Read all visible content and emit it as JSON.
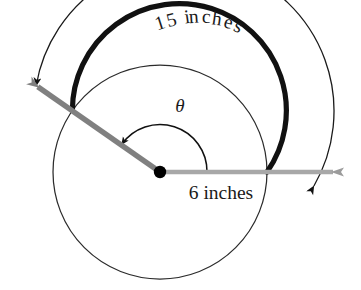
{
  "figure": {
    "name": "circle-sector-arc-length-diagram",
    "type": "geometry-diagram",
    "background_color": "#ffffff"
  },
  "labels": {
    "arc_length": "15 inches",
    "radius": "6 inches",
    "angle_symbol": "θ"
  },
  "colors": {
    "ray_gray": "#808080",
    "ray_gray_light": "#a8a8a8",
    "arc_black": "#111111",
    "circle_outline": "#2b2b2b",
    "center_dot": "#000000",
    "text": "#1a1a1a"
  },
  "geometry": {
    "center_x": 160,
    "center_y": 172,
    "circle_radius": 107,
    "bold_arc_radius": 107,
    "bold_arc_start_angle_deg": 145,
    "bold_arc_end_angle_deg": 0,
    "measure_arc_radius": 150,
    "theta_arc_radius": 47,
    "terminal_ray_angle_deg": 145,
    "initial_ray_angle_deg": 0,
    "terminal_ray_length": 148,
    "initial_ray_length": 185
  },
  "curved_label_chars": [
    {
      "ch": "1",
      "x": 162,
      "y": 29,
      "rot": -18
    },
    {
      "ch": "5",
      "x": 173,
      "y": 26,
      "rot": -14
    },
    {
      "ch": " ",
      "x": 182,
      "y": 24,
      "rot": -11
    },
    {
      "ch": "i",
      "x": 188,
      "y": 23,
      "rot": -8
    },
    {
      "ch": "n",
      "x": 194,
      "y": 23,
      "rot": -4
    },
    {
      "ch": "c",
      "x": 206,
      "y": 23,
      "rot": 2
    },
    {
      "ch": "h",
      "x": 216,
      "y": 25,
      "rot": 8
    },
    {
      "ch": "e",
      "x": 227,
      "y": 28,
      "rot": 15
    },
    {
      "ch": "s",
      "x": 236,
      "y": 32,
      "rot": 22
    }
  ]
}
